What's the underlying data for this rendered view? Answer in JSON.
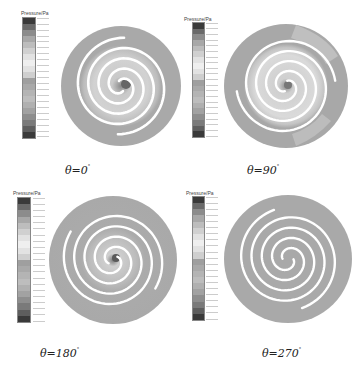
{
  "figure": {
    "legend_title": "Pressure/Pa",
    "legend_band_count": 20,
    "legend_gradient": [
      "#3a3a3a",
      "#6a6a6a",
      "#8c8c8c",
      "#a8a8a8",
      "#bdbdbd",
      "#d0d0d0",
      "#e2e2e2",
      "#efefef",
      "#e2e2e2",
      "#cfcfcf",
      "#9f9f9f",
      "#a9a9a9",
      "#b4b4b4",
      "#bdbdbd",
      "#b0b0b0",
      "#a2a2a2",
      "#8e8e8e",
      "#7a7a7a",
      "#5e5e5e",
      "#3a3a3a"
    ],
    "colors": {
      "disk_low_pressure": "#a9a9a9",
      "spiral_gap": "#ffffff",
      "inner_region_light": "#d4d4d4",
      "center_dark": "#555555"
    },
    "panels": [
      {
        "id": "theta-0",
        "label": "θ=0",
        "degree_sign": "°"
      },
      {
        "id": "theta-90",
        "label": "θ=90",
        "degree_sign": "°"
      },
      {
        "id": "theta-180",
        "label": "θ=180",
        "degree_sign": "°"
      },
      {
        "id": "theta-270",
        "label": "θ=270",
        "degree_sign": "°"
      }
    ]
  }
}
